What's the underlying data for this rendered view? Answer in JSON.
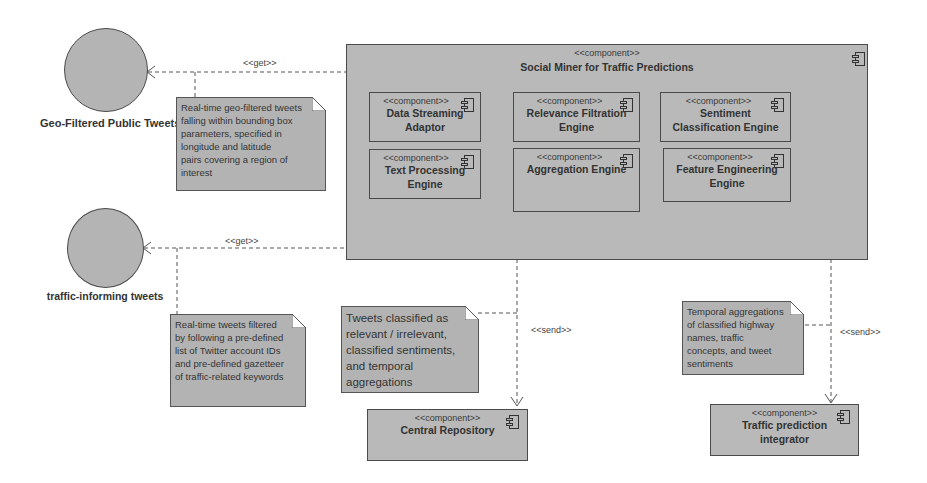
{
  "diagram": {
    "type": "UML component diagram",
    "interfaces": [
      {
        "id": "geo",
        "label": "Geo-Filtered Public Tweets"
      },
      {
        "id": "traffic",
        "label": "traffic-informing tweets"
      }
    ],
    "main_component": {
      "stereotype": "<<component>>",
      "name": "Social Miner for Traffic Predictions",
      "subcomponents": [
        {
          "stereotype": "<<component>>",
          "name": "Data Streaming Adaptor",
          "lines": [
            "Data Streaming",
            "Adaptor"
          ]
        },
        {
          "stereotype": "<<component>>",
          "name": "Relevance Filtration Engine",
          "lines": [
            "Relevance Filtration",
            "Engine"
          ]
        },
        {
          "stereotype": "<<component>>",
          "name": "Sentiment Classification Engine",
          "lines": [
            "Sentiment",
            "Classification Engine"
          ]
        },
        {
          "stereotype": "<<component>>",
          "name": "Text Processing Engine",
          "lines": [
            "Text Processing",
            "Engine"
          ]
        },
        {
          "stereotype": "<<component>>",
          "name": "Aggregation Engine",
          "lines": [
            "Aggregation Engine",
            ""
          ]
        },
        {
          "stereotype": "<<component>>",
          "name": "Feature Engineering Engine",
          "lines": [
            "Feature Engineering",
            "Engine"
          ]
        }
      ]
    },
    "external_components": [
      {
        "stereotype": "<<component>>",
        "name": "Central Repository",
        "lines": [
          "Central Repository",
          ""
        ]
      },
      {
        "stereotype": "<<component>>",
        "name": "Traffic prediction integrator",
        "lines": [
          "Traffic prediction",
          "integrator"
        ]
      }
    ],
    "edges": [
      {
        "from": "Social Miner for Traffic Predictions",
        "to": "Geo-Filtered Public Tweets",
        "label": "<<get>>"
      },
      {
        "from": "Social Miner for Traffic Predictions",
        "to": "traffic-informing tweets",
        "label": "<<get>>"
      },
      {
        "from": "Social Miner for Traffic Predictions",
        "to": "Central Repository",
        "label": "<<send>>"
      },
      {
        "from": "Social Miner for Traffic Predictions",
        "to": "Traffic prediction integrator",
        "label": "<<send>>"
      }
    ],
    "notes": [
      {
        "id": "note-geo",
        "lines": [
          "Real-time geo-filtered tweets",
          "falling within bounding box",
          "parameters, specified in",
          "longitude and latitude",
          "pairs covering a region of",
          "interest"
        ]
      },
      {
        "id": "note-traffic",
        "lines": [
          "Real-time tweets filtered",
          "by following a pre-defined",
          "list of Twitter account IDs",
          "and pre-defined gazetteer",
          "of traffic-related keywords"
        ]
      },
      {
        "id": "note-repo",
        "lines": [
          "Tweets classified as",
          "relevant / irrelevant,",
          "classified sentiments,",
          "and temporal",
          "aggregations"
        ]
      },
      {
        "id": "note-integrator",
        "lines": [
          "Temporal aggregations",
          "of classified highway",
          "names, traffic",
          "concepts, and tweet",
          "sentiments"
        ]
      }
    ]
  }
}
